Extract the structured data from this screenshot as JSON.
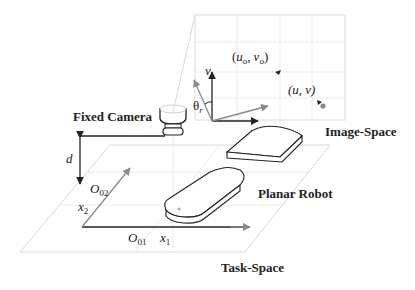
{
  "diagram": {
    "labels": {
      "fixed_camera": "Fixed Camera",
      "image_space": "Image-Space",
      "task_space": "Task-Space",
      "planar_robot": "Planar Robot",
      "distance": "d",
      "theta": "θ",
      "theta_sub": "r",
      "u_axis": "u",
      "v_axis": "v",
      "origin_point": {
        "open": "(",
        "u": "u",
        "u_sub": "o",
        "comma": ",",
        "v": "v",
        "v_sub": "o",
        "close": ")"
      },
      "current_point": "(u, v)",
      "o01": {
        "main": "O",
        "sub": "01"
      },
      "o02": {
        "main": "O",
        "sub": "02"
      },
      "x1": {
        "main": "x",
        "sub": "1"
      },
      "x2": {
        "main": "x",
        "sub": "2"
      }
    },
    "colors": {
      "ink": "#222222",
      "rotated_axes": "#8a8a8a",
      "plane_lines": "#d9d9d9",
      "point": "#8a8a8a"
    }
  }
}
